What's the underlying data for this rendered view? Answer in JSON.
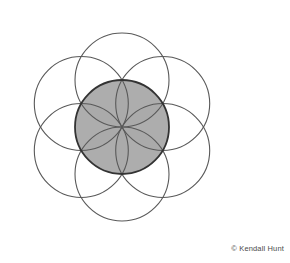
{
  "figure": {
    "background_color": "#ffffff",
    "stroke_color": "#595959",
    "center_stroke_color": "#333333",
    "center_fill_color": "#c4c4c4",
    "petal_overlap_fill_color": "#a8a8a8",
    "stroke_width": 1.1,
    "center_stroke_width": 1.8,
    "center": {
      "x": 122,
      "y": 127
    },
    "radius": 47,
    "petal_count": 6,
    "petal_angles_deg": [
      270,
      330,
      30,
      90,
      150,
      210
    ],
    "petals": [
      {
        "name": "petal-top",
        "cx": 122,
        "cy": 80,
        "r": 47
      },
      {
        "name": "petal-upper-right",
        "cx": 162.7,
        "cy": 103.5,
        "r": 47
      },
      {
        "name": "petal-lower-right",
        "cx": 162.7,
        "cy": 150.5,
        "r": 47
      },
      {
        "name": "petal-bottom",
        "cx": 122,
        "cy": 174,
        "r": 47
      },
      {
        "name": "petal-lower-left",
        "cx": 81.3,
        "cy": 150.5,
        "r": 47
      },
      {
        "name": "petal-upper-left",
        "cx": 81.3,
        "cy": 103.5,
        "r": 47
      }
    ],
    "center_circle": {
      "name": "center-circle",
      "cx": 122,
      "cy": 127,
      "r": 47
    }
  },
  "credit": {
    "text": "© Kendall Hunt",
    "color": "#4a4a4a"
  }
}
